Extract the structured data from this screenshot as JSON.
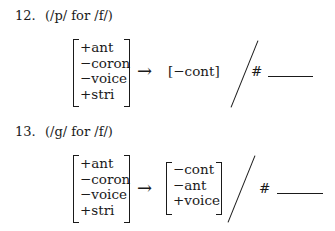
{
  "rules": [
    {
      "number": "12.",
      "description": "(/p/ for /f/)",
      "input_features": [
        "+ant",
        "−coron",
        "−voice",
        "+stri"
      ],
      "arrow": "→",
      "output_features": [
        "[−cont]"
      ],
      "environment_boundary": "#"
    },
    {
      "number": "13.",
      "description": "(/g/ for /f/)",
      "input_features": [
        "+ant",
        "−coron",
        "−voice",
        "+stri"
      ],
      "arrow": "→",
      "output_features": [
        "−cont",
        "−ant",
        "+voice"
      ],
      "environment_boundary": "#"
    }
  ]
}
